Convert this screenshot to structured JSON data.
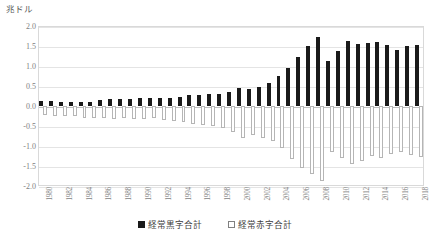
{
  "chart_data": {
    "type": "bar",
    "title": "",
    "subtitle": "",
    "unit_label": "兆ドル",
    "xlabel": "",
    "ylabel": "",
    "ylim": [
      -2.0,
      2.0
    ],
    "yticks": [
      "2.0",
      "1.5",
      "1.0",
      "0.5",
      "0.0",
      "-0.5",
      "-1.0",
      "-1.5",
      "-2.0"
    ],
    "ytick_values": [
      2.0,
      1.5,
      1.0,
      0.5,
      0.0,
      -0.5,
      -1.0,
      -1.5,
      -2.0
    ],
    "grid": true,
    "legend_position": "bottom",
    "categories": [
      "1980",
      "1981",
      "1982",
      "1983",
      "1984",
      "1985",
      "1986",
      "1987",
      "1988",
      "1989",
      "1990",
      "1991",
      "1992",
      "1993",
      "1994",
      "1995",
      "1996",
      "1997",
      "1998",
      "1999",
      "2000",
      "2001",
      "2002",
      "2003",
      "2004",
      "2005",
      "2006",
      "2007",
      "2008",
      "2009",
      "2010",
      "2011",
      "2012",
      "2013",
      "2014",
      "2015",
      "2016",
      "2017",
      "2018"
    ],
    "xtick_labels_shown": [
      "1980",
      "1982",
      "1984",
      "1986",
      "1988",
      "1990",
      "1992",
      "1994",
      "1996",
      "1998",
      "2000",
      "2002",
      "2004",
      "2006",
      "2008",
      "2010",
      "2012",
      "2014",
      "2016",
      "2018"
    ],
    "series": [
      {
        "name": "経常黒字合計",
        "color": "#1a1a1a",
        "style": "filled",
        "values": [
          0.12,
          0.13,
          0.1,
          0.09,
          0.11,
          0.11,
          0.15,
          0.17,
          0.18,
          0.17,
          0.19,
          0.2,
          0.19,
          0.2,
          0.22,
          0.27,
          0.28,
          0.31,
          0.31,
          0.34,
          0.44,
          0.42,
          0.48,
          0.58,
          0.74,
          0.96,
          1.23,
          1.51,
          1.73,
          1.12,
          1.37,
          1.62,
          1.56,
          1.58,
          1.6,
          1.52,
          1.4,
          1.49,
          1.52
        ]
      },
      {
        "name": "経常赤字合計",
        "color": "#ffffff",
        "style": "hollow",
        "values": [
          -0.23,
          -0.26,
          -0.25,
          -0.26,
          -0.3,
          -0.31,
          -0.3,
          -0.33,
          -0.31,
          -0.33,
          -0.33,
          -0.3,
          -0.36,
          -0.38,
          -0.41,
          -0.45,
          -0.47,
          -0.5,
          -0.55,
          -0.66,
          -0.79,
          -0.73,
          -0.8,
          -0.88,
          -1.04,
          -1.32,
          -1.55,
          -1.71,
          -1.87,
          -1.15,
          -1.31,
          -1.46,
          -1.38,
          -1.26,
          -1.29,
          -1.21,
          -1.15,
          -1.22,
          -1.27
        ]
      }
    ]
  },
  "legend": {
    "items": [
      {
        "label": "経常黒字合計",
        "style": "filled"
      },
      {
        "label": "経常赤字合計",
        "style": "hollow"
      }
    ]
  }
}
